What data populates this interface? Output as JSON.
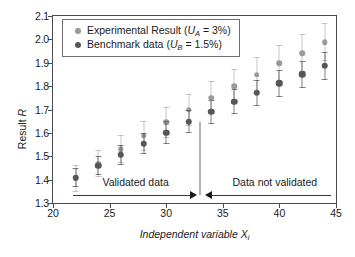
{
  "chart_data": {
    "type": "scatter",
    "title": "",
    "xlabel": "Independent variable  X",
    "xlabel_sub": "i",
    "ylabel_prefix": "Result ",
    "ylabel_italic": "R",
    "xlim": [
      20,
      45
    ],
    "ylim": [
      1.3,
      2.1
    ],
    "xticks": [
      20,
      25,
      30,
      35,
      40,
      45
    ],
    "yticks": [
      "1.3",
      "1.4",
      "1.5",
      "1.6",
      "1.7",
      "1.8",
      "1.9",
      "2.0",
      "2.1"
    ],
    "grid": false,
    "legend_position": "upper-left",
    "x": [
      22,
      24,
      26,
      28,
      30,
      32,
      34,
      36,
      38,
      40,
      42,
      44
    ],
    "series": [
      {
        "name": "Experimental Result",
        "uncertainty_label": "U",
        "uncertainty_sub": "A",
        "uncertainty_value": "3%",
        "color": "#9a9a9a",
        "marker_size": 5.5,
        "values": [
          1.405,
          1.468,
          1.53,
          1.588,
          1.645,
          1.698,
          1.75,
          1.8,
          1.848,
          1.897,
          1.941,
          1.988
        ],
        "err_low": [
          1.348,
          1.41,
          1.47,
          1.524,
          1.578,
          1.629,
          1.679,
          1.726,
          1.772,
          1.818,
          1.861,
          1.906
        ],
        "err_high": [
          1.462,
          1.526,
          1.59,
          1.652,
          1.712,
          1.767,
          1.821,
          1.874,
          1.924,
          1.976,
          2.021,
          2.07
        ]
      },
      {
        "name": "Benchmark data",
        "uncertainty_label": "U",
        "uncertainty_sub": "B",
        "uncertainty_value": "1.5%",
        "color": "#575757",
        "marker_size": 6.5,
        "values": [
          1.408,
          1.46,
          1.506,
          1.554,
          1.601,
          1.648,
          1.69,
          1.733,
          1.772,
          1.812,
          1.851,
          1.888
        ],
        "err_low": [
          1.367,
          1.418,
          1.462,
          1.508,
          1.553,
          1.598,
          1.639,
          1.68,
          1.717,
          1.755,
          1.793,
          1.828
        ],
        "err_high": [
          1.449,
          1.502,
          1.55,
          1.6,
          1.649,
          1.698,
          1.741,
          1.786,
          1.827,
          1.869,
          1.909,
          1.948
        ]
      }
    ],
    "annotations": {
      "divider_x": 33,
      "divider_y_top": 1.645,
      "left_label": "Validated data",
      "left_label_x": 27.3,
      "right_label": "Data not validated",
      "right_label_x": 39.6,
      "label_y": 1.368,
      "arrow_y": 1.335,
      "left_arrow_from": 21.8,
      "left_arrow_to": 32.6,
      "right_arrow_from": 33.4,
      "right_arrow_to": 44.6
    }
  }
}
